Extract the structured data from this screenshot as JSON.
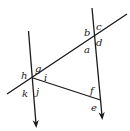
{
  "diagram": {
    "type": "geometry-angles",
    "colors": {
      "line": "#1a1a1a",
      "background": "#ffffff"
    },
    "lines": {
      "left_vertical": {
        "x1": 28.5,
        "y1": 31,
        "x2": 36,
        "y2": 124,
        "arrow": "end"
      },
      "right_vertical": {
        "x1": 92,
        "y1": 8,
        "x2": 102,
        "y2": 116,
        "arrow": "end"
      },
      "transversal": {
        "x1": 7,
        "y1": 94,
        "x2": 127,
        "y2": 14
      },
      "lower_segment": {
        "x1": 33,
        "y1": 78,
        "x2": 100.5,
        "y2": 100
      }
    },
    "labels": {
      "a": "a",
      "b": "b",
      "c": "c",
      "d": "d",
      "e": "e",
      "f": "f",
      "g": "g",
      "h": "h",
      "i": "i",
      "j": "j",
      "k": "k"
    }
  }
}
